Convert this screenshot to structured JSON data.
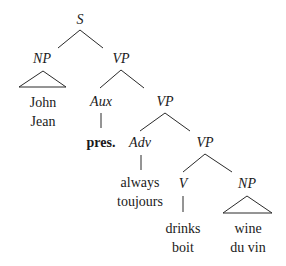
{
  "diagram": {
    "type": "syntax-tree",
    "nodes": {
      "s": "S",
      "np1": "NP",
      "vp1": "VP",
      "aux": "Aux",
      "vp2": "VP",
      "adv": "Adv",
      "vp3": "VP",
      "v": "V",
      "np2": "NP"
    },
    "leaves": {
      "subject_en": "John",
      "subject_fr": "Jean",
      "aux_value": "pres.",
      "adv_en": "always",
      "adv_fr": "toujours",
      "verb_en": "drinks",
      "verb_fr": "boit",
      "object_en": "wine",
      "object_fr": "du vin"
    }
  }
}
